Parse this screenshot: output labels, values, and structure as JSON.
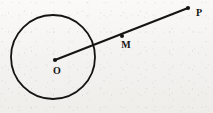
{
  "figure": {
    "type": "geometry-diagram",
    "canvas": {
      "width": 213,
      "height": 113
    },
    "background_color": "#f6f5f3",
    "ink_color": "#141414",
    "shapes": {
      "circle": {
        "name": "circle",
        "center_x": 53,
        "center_y": 57,
        "radius": 42,
        "stroke_color": "#141414",
        "stroke_width": 1.8,
        "fill": "none"
      },
      "segment": {
        "name": "segment-OP",
        "x1": 55,
        "y1": 60,
        "x2": 188,
        "y2": 8,
        "stroke_color": "#141414",
        "stroke_width": 2.0
      }
    },
    "points": [
      {
        "id": "O",
        "label": "O",
        "x": 55,
        "y": 60,
        "dot_radius": 2.1,
        "label_x": 57,
        "label_y": 72
      },
      {
        "id": "M",
        "label": "M",
        "x": 122,
        "y": 36,
        "dot_radius": 2.0,
        "label_x": 126,
        "label_y": 46
      },
      {
        "id": "P",
        "label": "P",
        "x": 188,
        "y": 8,
        "dot_radius": 2.1,
        "label_x": 199,
        "label_y": 14
      }
    ]
  }
}
